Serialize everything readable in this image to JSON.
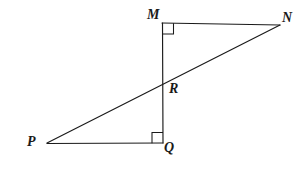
{
  "figure": {
    "background_color": "#ffffff",
    "stroke_color": "#1a1a1a",
    "vertices": [
      {
        "name": "M",
        "label": "M",
        "x": 162,
        "y": 23,
        "label_x": 147,
        "label_y": 8
      },
      {
        "name": "N",
        "label": "N",
        "x": 280,
        "y": 25,
        "label_x": 282,
        "label_y": 11
      },
      {
        "name": "R",
        "label": "R",
        "x": 163,
        "y": 85,
        "label_x": 169,
        "label_y": 82
      },
      {
        "name": "P",
        "label": "P",
        "x": 47,
        "y": 143,
        "label_x": 27,
        "label_y": 135
      },
      {
        "name": "Q",
        "label": "Q",
        "x": 163,
        "y": 143,
        "label_x": 164,
        "label_y": 141
      }
    ],
    "segments": [
      {
        "name": "segment-MN",
        "from": "M",
        "to": "N"
      },
      {
        "name": "segment-MQ",
        "from": "M",
        "to": "Q"
      },
      {
        "name": "segment-PQ",
        "from": "P",
        "to": "Q"
      },
      {
        "name": "segment-PN",
        "from": "P",
        "to": "N"
      }
    ],
    "right_angles": [
      {
        "name": "right-angle-M",
        "at": "M",
        "measure": "90"
      },
      {
        "name": "right-angle-Q",
        "at": "Q",
        "measure": "90"
      }
    ]
  }
}
